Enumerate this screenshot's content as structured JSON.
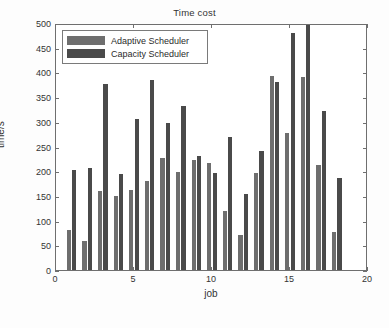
{
  "chart_data": {
    "type": "bar",
    "title": "Time cost",
    "xlabel": "job",
    "ylabel": "time/s",
    "xlim": [
      0,
      20
    ],
    "ylim": [
      0,
      500
    ],
    "xticks": [
      0,
      5,
      10,
      15,
      20
    ],
    "yticks": [
      0,
      50,
      100,
      150,
      200,
      250,
      300,
      350,
      400,
      450,
      500
    ],
    "grid": false,
    "legend_position": "top-left",
    "categories": [
      1,
      2,
      3,
      4,
      5,
      6,
      7,
      8,
      9,
      10,
      11,
      12,
      13,
      14,
      15,
      16,
      17,
      18
    ],
    "series": [
      {
        "name": "Adaptive Scheduler",
        "color": "#6e6e6e",
        "values": [
          80,
          58,
          159,
          150,
          162,
          181,
          226,
          199,
          222,
          216,
          120,
          70,
          197,
          393,
          277,
          390,
          213,
          76
        ]
      },
      {
        "name": "Capacity Scheduler",
        "color": "#4a4a4a",
        "values": [
          203,
          206,
          377,
          195,
          305,
          385,
          298,
          333,
          230,
          196,
          269,
          153,
          241,
          381,
          479,
          520,
          322,
          187
        ]
      }
    ]
  },
  "axis": {
    "y_tick_labels": [
      "500",
      "450",
      "400",
      "350",
      "300",
      "250",
      "200",
      "150",
      "100",
      "50",
      "0"
    ],
    "x_tick_labels": [
      "0",
      "5",
      "10",
      "15",
      "20"
    ]
  },
  "legend": {
    "items": [
      {
        "label": "Adaptive Scheduler",
        "color": "#6e6e6e"
      },
      {
        "label": "Capacity Scheduler",
        "color": "#4a4a4a"
      }
    ]
  }
}
